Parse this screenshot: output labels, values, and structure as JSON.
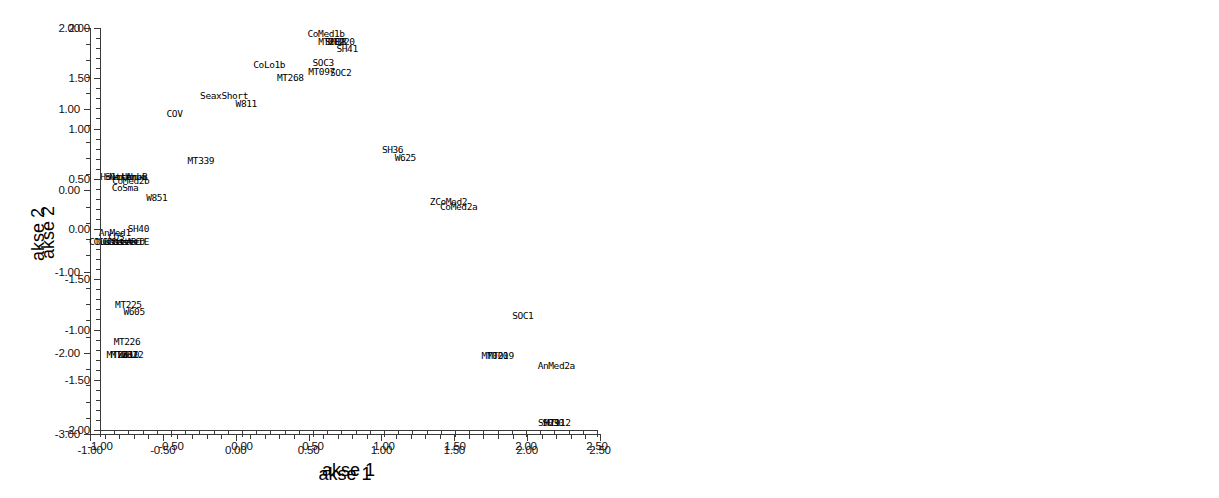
{
  "figure": {
    "kind": "two-panel-scatter",
    "background": "#ffffff",
    "foreground": "#000000"
  },
  "chart_data": [
    {
      "type": "scatter",
      "panel": "left",
      "title": "",
      "xlabel": "akse 1",
      "ylabel": "akse 2",
      "xlim": [
        -1.0,
        2.5
      ],
      "ylim": [
        -3.0,
        2.0
      ],
      "xticks": [
        "-1.00",
        "-0.50",
        "0.00",
        "0.50",
        "1.00",
        "1.50",
        "2.00",
        "2.50"
      ],
      "xtick_values": [
        -1.0,
        -0.5,
        0.0,
        0.5,
        1.0,
        1.5,
        2.0,
        2.5
      ],
      "yticks": [
        "2.00",
        "1.00",
        "0.00",
        "-1.00",
        "-2.00",
        "-3.00"
      ],
      "ytick_values": [
        2.0,
        1.0,
        0.0,
        -1.0,
        -2.0,
        -3.0
      ],
      "minor_ticks_per_interval": 4,
      "grid": false,
      "legend": null,
      "marker": "none-text-labels-only",
      "points": [
        {
          "label": "CoMed1b",
          "x": 0.62,
          "y": 1.93
        },
        {
          "label": "SOC3",
          "x": 0.6,
          "y": 1.57
        },
        {
          "label": "SOC2",
          "x": 0.72,
          "y": 1.44
        },
        {
          "label": "CoLo1b",
          "x": 0.23,
          "y": 1.55
        },
        {
          "label": "SeaxShort",
          "x": -0.08,
          "y": 1.16
        },
        {
          "label": "COV",
          "x": -0.42,
          "y": 0.94
        },
        {
          "label": "HolmUr",
          "x": -0.82,
          "y": 0.17
        },
        {
          "label": "Sutton",
          "x": -0.79,
          "y": 0.17
        },
        {
          "label": "Northum",
          "x": -0.74,
          "y": 0.17
        },
        {
          "label": "ArbB",
          "x": -0.68,
          "y": 0.17
        },
        {
          "label": "CoMed2b",
          "x": -0.72,
          "y": 0.11
        },
        {
          "label": "CoSma",
          "x": -0.76,
          "y": 0.03
        },
        {
          "label": "ZCoMed2",
          "x": 1.46,
          "y": -0.14
        },
        {
          "label": "CoMed2a",
          "x": 1.53,
          "y": -0.21
        },
        {
          "label": "AnMed1",
          "x": -0.83,
          "y": -0.52
        },
        {
          "label": "COS",
          "x": -0.82,
          "y": -0.58
        },
        {
          "label": "ClusterA",
          "x": -0.86,
          "y": -0.64
        },
        {
          "label": "ClusterB",
          "x": -0.83,
          "y": -0.64
        },
        {
          "label": "ClusterC",
          "x": -0.8,
          "y": -0.64
        },
        {
          "label": "ClusterD",
          "x": -0.77,
          "y": -0.64
        },
        {
          "label": "ClusterE",
          "x": -0.74,
          "y": -0.64
        },
        {
          "label": "SOC1",
          "x": 1.97,
          "y": -1.55
        },
        {
          "label": "AnMed2a",
          "x": 2.2,
          "y": -2.16
        }
      ]
    },
    {
      "type": "scatter",
      "panel": "right",
      "title": "",
      "xlabel": "akse 1",
      "ylabel": "akse 2",
      "xlim": [
        -1.0,
        2.5
      ],
      "ylim": [
        -2.0,
        2.0
      ],
      "xticks": [
        "-1.00",
        "-0.50",
        "0.00",
        "0.50",
        "1.00",
        "1.50",
        "2.00",
        "2.50"
      ],
      "xtick_values": [
        -1.0,
        -0.5,
        0.0,
        0.5,
        1.0,
        1.5,
        2.0,
        2.5
      ],
      "yticks": [
        "2.00",
        "1.50",
        "1.00",
        "0.50",
        "0.00",
        "-1.50",
        "-1.00",
        "-1.50",
        "-2.00"
      ],
      "ytick_values": [
        2.0,
        1.5,
        1.0,
        0.5,
        0.0,
        -0.5,
        -1.0,
        -1.5,
        -2.0
      ],
      "minor_ticks_per_interval": 4,
      "grid": false,
      "legend": null,
      "marker": "none-text-labels-only",
      "points": [
        {
          "label": "MT289",
          "x": 0.63,
          "y": 1.86
        },
        {
          "label": "SH38",
          "x": 0.66,
          "y": 1.86
        },
        {
          "label": "MT220",
          "x": 0.7,
          "y": 1.86
        },
        {
          "label": "SH41",
          "x": 0.74,
          "y": 1.79
        },
        {
          "label": "MT097",
          "x": 0.56,
          "y": 1.56
        },
        {
          "label": "MT268",
          "x": 0.34,
          "y": 1.5
        },
        {
          "label": "W811",
          "x": 0.03,
          "y": 1.24
        },
        {
          "label": "SH36",
          "x": 1.06,
          "y": 0.79
        },
        {
          "label": "W625",
          "x": 1.15,
          "y": 0.71
        },
        {
          "label": "MT339",
          "x": -0.29,
          "y": 0.68
        },
        {
          "label": "W851",
          "x": -0.6,
          "y": 0.31
        },
        {
          "label": "SH40",
          "x": -0.73,
          "y": 0.0
        },
        {
          "label": "MT225",
          "x": -0.8,
          "y": -0.76
        },
        {
          "label": "W605",
          "x": -0.76,
          "y": -0.83
        },
        {
          "label": "MT226",
          "x": -0.81,
          "y": -1.12
        },
        {
          "label": "MT231",
          "x": -0.86,
          "y": -1.25
        },
        {
          "label": "MT232",
          "x": -0.83,
          "y": -1.25
        },
        {
          "label": "W610",
          "x": -0.8,
          "y": -1.25
        },
        {
          "label": "W612",
          "x": -0.77,
          "y": -1.25
        },
        {
          "label": "MT019",
          "x": 1.82,
          "y": -1.26
        },
        {
          "label": "MT020",
          "x": 1.78,
          "y": -1.26
        },
        {
          "label": "SH29",
          "x": 2.16,
          "y": -1.93
        },
        {
          "label": "SH30",
          "x": 2.19,
          "y": -1.93
        },
        {
          "label": "MT112",
          "x": 2.22,
          "y": -1.93
        }
      ]
    }
  ]
}
